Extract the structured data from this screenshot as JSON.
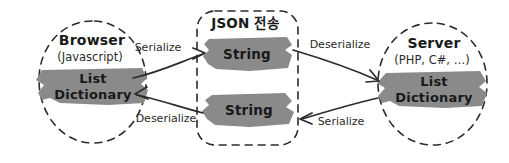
{
  "diagram": {
    "background_color": "#ffffff",
    "ink_color": "#2b2b2b",
    "marker_color": "#8a8a8a",
    "nodes": {
      "browser": {
        "id": "browser",
        "shape": "dashed-circle",
        "title": "Browser",
        "subtitle": "(Javascript)",
        "marker_line_1": "List",
        "marker_line_2": "Dictionary"
      },
      "json": {
        "id": "json",
        "shape": "dashed-rounded-rect",
        "title": "JSON 전송",
        "marker_top": "String",
        "marker_bottom": "String"
      },
      "server": {
        "id": "server",
        "shape": "dashed-circle",
        "title": "Server",
        "subtitle": "(PHP, C#, …)",
        "marker_line_1": "List",
        "marker_line_2": "Dictionary"
      }
    },
    "edges": [
      {
        "id": "browser-to-json",
        "label": "Serialize",
        "from": "browser",
        "to": "json-string-top",
        "direction": "right"
      },
      {
        "id": "json-to-server",
        "label": "Deserialize",
        "from": "json-string-top",
        "to": "server",
        "direction": "right"
      },
      {
        "id": "server-to-json",
        "label": "Serialize",
        "from": "server",
        "to": "json-string-bottom",
        "direction": "left"
      },
      {
        "id": "json-to-browser",
        "label": "Deserialize",
        "from": "json-string-bottom",
        "to": "browser",
        "direction": "left"
      }
    ]
  }
}
